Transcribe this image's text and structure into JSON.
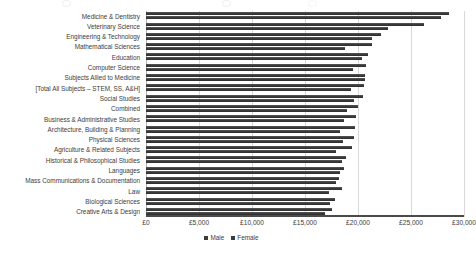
{
  "chart_data": {
    "type": "bar",
    "orientation": "horizontal",
    "title": "",
    "subtitle": "",
    "xlabel": "",
    "ylabel": "",
    "xlim": [
      0,
      30000
    ],
    "xticks": [
      0,
      5000,
      10000,
      15000,
      20000,
      25000,
      30000
    ],
    "xtick_labels": [
      "£0",
      "£5,000",
      "£10,000",
      "£15,000",
      "£20,000",
      "£25,000",
      "£30,000"
    ],
    "grid": true,
    "grid_axis": "x",
    "legend_position": "bottom",
    "legend": [
      "Male",
      "Female"
    ],
    "categories": [
      "Medicine & Dentistry",
      "Veterinary Science",
      "Engineering & Technology",
      "Mathematical Sciences",
      "Education",
      "Computer Science",
      "Subjects Allied to Medicine",
      "[Total All Subjects – STEM, SS, A&H]",
      "Social Studies",
      "Combined",
      "Business & Administrative Studies",
      "Architecture, Building & Planning",
      "Physical Sciences",
      "Agriculture & Related Subjects",
      "Historical & Philosophical Studies",
      "Languages",
      "Mass Communications & Documentation",
      "Law",
      "Biological Sciences",
      "Creative Arts & Design"
    ],
    "series": [
      {
        "name": "Male",
        "color": "#3c3c3c",
        "values": [
          28600,
          26200,
          22200,
          21300,
          20900,
          20800,
          20700,
          20600,
          20500,
          20000,
          19800,
          19700,
          19600,
          19400,
          18900,
          18700,
          18200,
          18500,
          17800,
          17500
        ]
      },
      {
        "name": "Female",
        "color": "#3c3c3c",
        "values": [
          27800,
          22800,
          21300,
          18800,
          20400,
          19500,
          20700,
          19300,
          19600,
          19000,
          18700,
          18300,
          18600,
          17900,
          18500,
          18300,
          17900,
          17300,
          17400,
          16900
        ]
      }
    ]
  }
}
